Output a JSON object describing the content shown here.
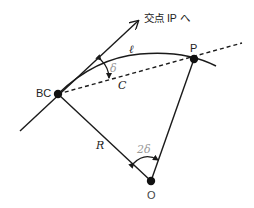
{
  "diagram": {
    "type": "circular-curve-deflection-angle",
    "colors": {
      "line": "#1a1a1a",
      "point": "#111111",
      "label": "#222222",
      "angle_label_gray": "#9a9a9a",
      "background": "#ffffff"
    },
    "points": {
      "bc": {
        "label": "BC",
        "x": 58,
        "y": 94
      },
      "p": {
        "label": "P",
        "x": 194,
        "y": 59
      },
      "o": {
        "label": "O",
        "x": 151,
        "y": 181
      }
    },
    "labels": {
      "arrow_label": "交点 IP へ",
      "arc_length": "ℓ",
      "deflection_angle": "δ",
      "chord": "C",
      "radius": "R",
      "central_angle": "2δ"
    },
    "edges": [
      {
        "name": "tangent-line",
        "from": "bc",
        "to": "intersection-ip",
        "style": "solid",
        "arrow": true
      },
      {
        "name": "chord-line",
        "from": "bc",
        "to": "p",
        "style": "dashed",
        "extended": true
      },
      {
        "name": "arc",
        "from": "bc",
        "to": "p",
        "style": "solid"
      },
      {
        "name": "radius-bc",
        "from": "bc",
        "to": "o",
        "style": "solid"
      },
      {
        "name": "radius-p",
        "from": "p",
        "to": "o",
        "style": "solid"
      }
    ]
  }
}
